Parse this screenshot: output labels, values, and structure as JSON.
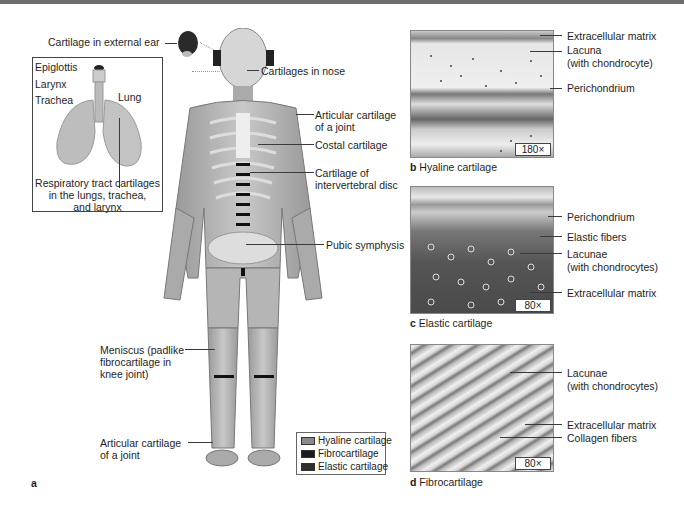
{
  "figure": {
    "panel_a_letter": "a",
    "labels_left": {
      "external_ear": "Cartilage in external ear",
      "meniscus_line1": "Meniscus (padlike",
      "meniscus_line2": "fibrocartilage in",
      "meniscus_line3": "knee joint)",
      "articular_lower_line1": "Articular cartilage",
      "articular_lower_line2": "of a joint"
    },
    "inset": {
      "epiglottis": "Epiglottis",
      "larynx": "Larynx",
      "trachea": "Trachea",
      "lung": "Lung",
      "caption_line1": "Respiratory tract cartilages",
      "caption_line2": "in the lungs, trachea,",
      "caption_line3": "and larynx"
    },
    "labels_right": {
      "nose": "Cartilages in nose",
      "articular_line1": "Articular cartilage",
      "articular_line2": "of a joint",
      "costal": "Costal cartilage",
      "intervertebral_line1": "Cartilage of",
      "intervertebral_line2": "intervertebral disc",
      "pubic": "Pubic symphysis"
    },
    "legend": {
      "items": [
        {
          "label": "Hyaline cartilage",
          "color": "#8a8a8a"
        },
        {
          "label": "Fibrocartilage",
          "color": "#1c1c1c"
        },
        {
          "label": "Elastic cartilage",
          "color": "#2e2e2e"
        }
      ]
    },
    "panels": {
      "b": {
        "letter": "b",
        "title": "Hyaline cartilage",
        "magnification": "180×",
        "labels": [
          "Extracellular matrix",
          "Lacuna",
          "(with chondrocyte)",
          "Perichondrium"
        ]
      },
      "c": {
        "letter": "c",
        "title": "Elastic cartilage",
        "magnification": "80×",
        "labels": [
          "Perichondrium",
          "Elastic fibers",
          "Lacunae",
          "(with chondrocytes)",
          "Extracellular matrix"
        ]
      },
      "d": {
        "letter": "d",
        "title": "Fibrocartilage",
        "magnification": "80×",
        "labels": [
          "Lacunae",
          "(with chondrocytes)",
          "Extracellular matrix",
          "Collagen fibers"
        ]
      }
    }
  }
}
